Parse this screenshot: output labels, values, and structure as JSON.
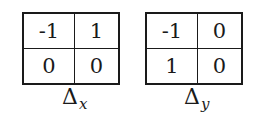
{
  "kernels": [
    {
      "name": "delta-x",
      "label": {
        "symbol": "Δ",
        "subscript": "x"
      },
      "cells": [
        [
          "-1",
          "1"
        ],
        [
          "0",
          "0"
        ]
      ]
    },
    {
      "name": "delta-y",
      "label": {
        "symbol": "Δ",
        "subscript": "y"
      },
      "cells": [
        [
          "-1",
          "0"
        ],
        [
          "1",
          "0"
        ]
      ]
    }
  ]
}
